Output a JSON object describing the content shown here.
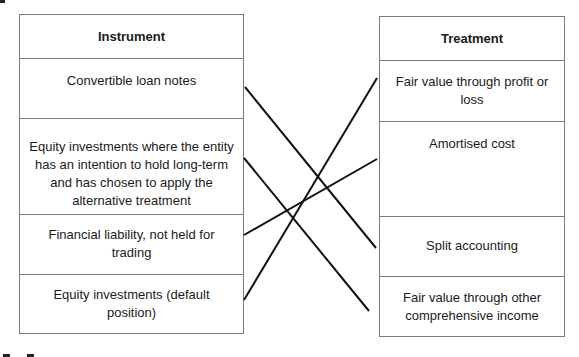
{
  "instrument_table": {
    "header": "Instrument",
    "rows": [
      {
        "label": "Convertible loan notes"
      },
      {
        "label": "Equity investments where the entity has an intention to hold long-term and has chosen to apply the alternative treatment"
      },
      {
        "label": "Financial liability, not held for trading"
      },
      {
        "label": "Equity investments (default position)"
      }
    ]
  },
  "treatment_table": {
    "header": "Treatment",
    "rows": [
      {
        "label": "Fair value through profit or loss"
      },
      {
        "label": "Amortised cost"
      },
      {
        "label": "Split accounting"
      },
      {
        "label": "Fair value through other comprehensive income"
      }
    ]
  },
  "connections": [
    {
      "from": "Convertible loan notes",
      "to": "Split accounting"
    },
    {
      "from": "Equity investments where the entity has an intention to hold long-term and has chosen to apply the alternative treatment",
      "to": "Fair value through other comprehensive income"
    },
    {
      "from": "Financial liability, not held for trading",
      "to": "Amortised cost"
    },
    {
      "from": "Equity investments (default position)",
      "to": "Fair value through profit or loss"
    }
  ],
  "colors": {
    "line": "#111111",
    "border": "#7a7a7a"
  }
}
